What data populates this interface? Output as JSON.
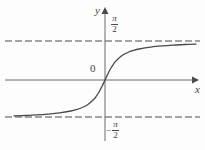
{
  "figure": {
    "background_color": "#fdfdfd",
    "line_color": "#4a4a4a",
    "axis_color": "#555555",
    "text_color": "#3f3f3f"
  },
  "labels": {
    "y_axis": "y",
    "x_axis": "x",
    "origin": "0",
    "asymptote_positive": {
      "sign": "",
      "numerator": "π",
      "denominator": "2"
    },
    "asymptote_negative": {
      "sign": "−",
      "numerator": "π",
      "denominator": "2"
    }
  },
  "chart_data": {
    "type": "line",
    "title": "",
    "xlabel": "x",
    "ylabel": "y",
    "function": "y = arctan(x)",
    "grid": false,
    "legend": null,
    "xlim": [
      -8,
      8
    ],
    "ylim": [
      -2.0,
      2.0
    ],
    "asymptotes": [
      {
        "type": "horizontal",
        "value": 1.5708,
        "label": "π/2",
        "style": "dashed"
      },
      {
        "type": "horizontal",
        "value": -1.5708,
        "label": "-π/2",
        "style": "dashed"
      }
    ],
    "axes": {
      "x_axis_y_value": 0,
      "y_axis_x_value": 0,
      "x_arrow": true,
      "y_arrow": true
    },
    "x": [
      -8.0,
      -7.0,
      -6.0,
      -5.0,
      -4.0,
      -3.0,
      -2.5,
      -2.0,
      -1.5,
      -1.0,
      -0.75,
      -0.5,
      -0.25,
      0.0,
      0.25,
      0.5,
      0.75,
      1.0,
      1.5,
      2.0,
      2.5,
      3.0,
      4.0,
      5.0,
      6.0,
      7.0,
      8.0
    ],
    "y": [
      -1.446,
      -1.429,
      -1.406,
      -1.373,
      -1.326,
      -1.249,
      -1.19,
      -1.107,
      -0.983,
      -0.785,
      -0.644,
      -0.464,
      -0.245,
      0.0,
      0.245,
      0.464,
      0.644,
      0.785,
      0.983,
      1.107,
      1.19,
      1.249,
      1.326,
      1.373,
      1.406,
      1.429,
      1.446
    ]
  },
  "geometry": {
    "x_axis_pixel_y": 80,
    "y_axis_pixel_x": 105,
    "upper_asymptote_pixel_y": 41,
    "lower_asymptote_pixel_y": 117,
    "dash_left": 5,
    "dash_right": 200,
    "curve_left": 10,
    "curve_right": 196
  }
}
